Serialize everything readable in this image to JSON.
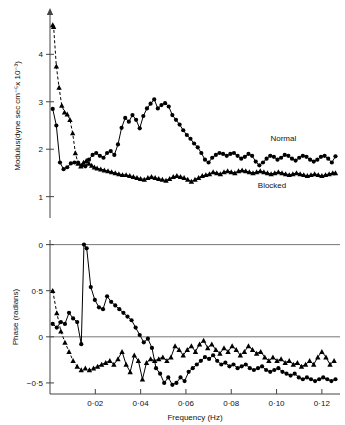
{
  "figure": {
    "background": "#ffffff",
    "ink": "#000000"
  },
  "chart_data": [
    {
      "type": "line",
      "id": "modulus-panel",
      "title": "",
      "xlabel": "",
      "ylabel": "Modulus(dyne sec cm⁻⁵x 10⁻³)",
      "xlim": [
        0.0,
        0.128
      ],
      "ylim": [
        0.55,
        4.85
      ],
      "yticks": [
        1,
        2,
        3,
        4
      ],
      "ytick_labels": [
        "1",
        "2",
        "3",
        "4"
      ],
      "xticks": [],
      "xtick_labels": [],
      "grid": false,
      "legend_position": "inline-annotation",
      "annotations": [
        {
          "text": "Normal",
          "x": 0.103,
          "y": 2.18
        },
        {
          "text": "Blocked",
          "x": 0.098,
          "y": 1.18
        }
      ],
      "series": [
        {
          "name": "Normal",
          "marker": "circle",
          "line": "solid",
          "x": [
            0.0012,
            0.0028,
            0.0044,
            0.006,
            0.0076,
            0.0092,
            0.0108,
            0.0124,
            0.014,
            0.0156,
            0.0172,
            0.0188,
            0.0204,
            0.022,
            0.0236,
            0.0252,
            0.0268,
            0.0284,
            0.03,
            0.0316,
            0.0332,
            0.0348,
            0.0364,
            0.038,
            0.0396,
            0.0412,
            0.0428,
            0.0444,
            0.046,
            0.0476,
            0.0492,
            0.0508,
            0.0524,
            0.054,
            0.0556,
            0.0572,
            0.0588,
            0.0604,
            0.062,
            0.0636,
            0.0652,
            0.0668,
            0.0684,
            0.07,
            0.0716,
            0.0732,
            0.0748,
            0.0764,
            0.078,
            0.0796,
            0.0812,
            0.0828,
            0.0844,
            0.086,
            0.0876,
            0.0892,
            0.0908,
            0.0924,
            0.094,
            0.0956,
            0.0972,
            0.0988,
            0.1004,
            0.102,
            0.1036,
            0.1052,
            0.1068,
            0.1084,
            0.11,
            0.1116,
            0.1132,
            0.1148,
            0.1164,
            0.118,
            0.1196,
            0.1212,
            0.1228,
            0.1244,
            0.126
          ],
          "y": [
            2.85,
            2.5,
            1.72,
            1.58,
            1.62,
            1.7,
            1.72,
            1.72,
            1.66,
            1.64,
            1.78,
            1.88,
            1.92,
            1.86,
            1.82,
            1.92,
            1.96,
            1.88,
            2.1,
            2.45,
            2.66,
            2.58,
            2.72,
            2.62,
            2.44,
            2.7,
            2.86,
            2.96,
            3.05,
            2.86,
            2.93,
            2.97,
            2.9,
            2.72,
            2.62,
            2.52,
            2.4,
            2.3,
            2.22,
            2.12,
            2.04,
            1.92,
            1.78,
            1.72,
            1.82,
            1.88,
            1.92,
            1.9,
            1.86,
            1.9,
            1.92,
            1.86,
            1.8,
            1.84,
            1.9,
            1.86,
            1.74,
            1.66,
            1.72,
            1.8,
            1.86,
            1.84,
            1.78,
            1.82,
            1.88,
            1.86,
            1.8,
            1.76,
            1.82,
            1.86,
            1.84,
            1.78,
            1.74,
            1.78,
            1.84,
            1.86,
            1.8,
            1.72,
            1.85
          ]
        },
        {
          "name": "Blocked",
          "marker": "triangle",
          "line": "dashed-then-solid",
          "x": [
            0.0012,
            0.0016,
            0.0028,
            0.004,
            0.0052,
            0.0064,
            0.0076,
            0.0088,
            0.01,
            0.0112,
            0.0124,
            0.0136,
            0.0148,
            0.016,
            0.0172,
            0.0184,
            0.0196,
            0.0208,
            0.0224,
            0.024,
            0.0256,
            0.0272,
            0.0288,
            0.0304,
            0.032,
            0.0336,
            0.0352,
            0.0368,
            0.0384,
            0.04,
            0.0416,
            0.0432,
            0.0448,
            0.0464,
            0.048,
            0.0496,
            0.0512,
            0.0528,
            0.0544,
            0.056,
            0.0576,
            0.0592,
            0.0608,
            0.0624,
            0.064,
            0.0656,
            0.0672,
            0.0688,
            0.0704,
            0.072,
            0.0736,
            0.0752,
            0.0768,
            0.0784,
            0.08,
            0.0816,
            0.0832,
            0.0848,
            0.0864,
            0.088,
            0.0896,
            0.0912,
            0.0928,
            0.0944,
            0.096,
            0.0976,
            0.0992,
            0.1008,
            0.1024,
            0.104,
            0.1056,
            0.1072,
            0.1088,
            0.1104,
            0.112,
            0.1136,
            0.1152,
            0.1168,
            0.1184,
            0.12,
            0.1216,
            0.1232,
            0.1248,
            0.126
          ],
          "y": [
            4.62,
            4.58,
            3.75,
            3.3,
            2.92,
            2.78,
            2.74,
            2.62,
            2.34,
            1.92,
            1.7,
            1.64,
            1.72,
            1.76,
            1.7,
            1.66,
            1.62,
            1.6,
            1.58,
            1.56,
            1.54,
            1.52,
            1.5,
            1.48,
            1.46,
            1.46,
            1.44,
            1.42,
            1.4,
            1.38,
            1.36,
            1.4,
            1.42,
            1.4,
            1.38,
            1.36,
            1.34,
            1.38,
            1.42,
            1.44,
            1.42,
            1.4,
            1.36,
            1.32,
            1.36,
            1.4,
            1.44,
            1.46,
            1.48,
            1.52,
            1.5,
            1.48,
            1.52,
            1.54,
            1.52,
            1.5,
            1.54,
            1.56,
            1.54,
            1.52,
            1.5,
            1.52,
            1.54,
            1.52,
            1.5,
            1.48,
            1.5,
            1.52,
            1.5,
            1.48,
            1.46,
            1.48,
            1.5,
            1.48,
            1.46,
            1.44,
            1.46,
            1.48,
            1.46,
            1.44,
            1.46,
            1.48,
            1.5,
            1.5
          ]
        }
      ]
    },
    {
      "type": "line",
      "id": "phase-panel",
      "title": "",
      "xlabel": "Frequency (Hz)",
      "ylabel": "Phase (radians)",
      "xlim": [
        0.0,
        0.128
      ],
      "ylim": [
        -0.62,
        1.05
      ],
      "yticks": [
        1.0,
        0.5,
        0.0,
        -0.5
      ],
      "ytick_labels": [
        "0",
        "0·5",
        "0",
        "−0·5"
      ],
      "xticks": [
        0.02,
        0.04,
        0.06,
        0.08,
        0.1,
        0.12
      ],
      "xtick_labels": [
        "0·02",
        "0·04",
        "0·06",
        "0·08",
        "0·10",
        "0·12"
      ],
      "grid": false,
      "gridlines_horizontal": [
        1.0,
        0.0
      ],
      "legend_position": "none",
      "series": [
        {
          "name": "Normal",
          "marker": "circle",
          "line": "solid",
          "x": [
            0.0012,
            0.003,
            0.0048,
            0.0066,
            0.0084,
            0.0102,
            0.012,
            0.0138,
            0.015,
            0.0162,
            0.018,
            0.0198,
            0.0216,
            0.0234,
            0.0252,
            0.027,
            0.0288,
            0.0306,
            0.0324,
            0.0342,
            0.036,
            0.0378,
            0.0396,
            0.0414,
            0.0432,
            0.045,
            0.0468,
            0.0486,
            0.0504,
            0.0522,
            0.054,
            0.0558,
            0.0576,
            0.0594,
            0.0612,
            0.063,
            0.0648,
            0.0666,
            0.0684,
            0.0702,
            0.072,
            0.0738,
            0.0756,
            0.0774,
            0.0792,
            0.081,
            0.0828,
            0.0846,
            0.0864,
            0.0882,
            0.09,
            0.0918,
            0.0936,
            0.0954,
            0.0972,
            0.099,
            0.1008,
            0.1026,
            0.1044,
            0.1062,
            0.108,
            0.1098,
            0.1116,
            0.1134,
            0.1152,
            0.117,
            0.1188,
            0.1206,
            0.1224,
            0.1242,
            0.126
          ],
          "y": [
            0.14,
            0.1,
            0.16,
            0.14,
            0.26,
            0.2,
            0.16,
            -0.08,
            1.0,
            0.96,
            0.54,
            0.4,
            0.32,
            0.3,
            0.44,
            0.38,
            0.34,
            0.3,
            0.26,
            0.22,
            0.18,
            0.1,
            0.02,
            -0.06,
            -0.02,
            -0.12,
            -0.34,
            -0.4,
            -0.5,
            -0.44,
            -0.52,
            -0.5,
            -0.44,
            -0.48,
            -0.38,
            -0.34,
            -0.3,
            -0.26,
            -0.22,
            -0.24,
            -0.2,
            -0.26,
            -0.3,
            -0.28,
            -0.32,
            -0.3,
            -0.34,
            -0.32,
            -0.3,
            -0.34,
            -0.36,
            -0.34,
            -0.32,
            -0.36,
            -0.38,
            -0.36,
            -0.34,
            -0.38,
            -0.4,
            -0.42,
            -0.4,
            -0.44,
            -0.46,
            -0.44,
            -0.46,
            -0.48,
            -0.46,
            -0.44,
            -0.46,
            -0.48,
            -0.46
          ]
        },
        {
          "name": "Blocked",
          "marker": "triangle",
          "line": "dashed-then-solid",
          "x": [
            0.0012,
            0.003,
            0.0048,
            0.0066,
            0.0084,
            0.0102,
            0.012,
            0.0138,
            0.0156,
            0.0174,
            0.0192,
            0.021,
            0.0228,
            0.0246,
            0.0264,
            0.0282,
            0.03,
            0.0318,
            0.0336,
            0.0354,
            0.0372,
            0.039,
            0.0408,
            0.0426,
            0.0444,
            0.0462,
            0.048,
            0.0498,
            0.0516,
            0.0534,
            0.0552,
            0.057,
            0.0588,
            0.0606,
            0.0624,
            0.0642,
            0.066,
            0.0678,
            0.0696,
            0.0714,
            0.0732,
            0.075,
            0.0768,
            0.0786,
            0.0804,
            0.0822,
            0.084,
            0.0858,
            0.0876,
            0.0894,
            0.0912,
            0.093,
            0.0948,
            0.0966,
            0.0984,
            0.1002,
            0.102,
            0.1038,
            0.1056,
            0.1074,
            0.1092,
            0.111,
            0.1128,
            0.1146,
            0.1164,
            0.1182,
            0.12,
            0.1218,
            0.1236,
            0.1254
          ],
          "y": [
            0.5,
            0.26,
            0.06,
            -0.06,
            -0.16,
            -0.26,
            -0.32,
            -0.36,
            -0.34,
            -0.36,
            -0.34,
            -0.32,
            -0.3,
            -0.28,
            -0.26,
            -0.3,
            -0.24,
            -0.16,
            -0.3,
            -0.38,
            -0.2,
            -0.26,
            -0.46,
            -0.28,
            -0.24,
            -0.26,
            -0.24,
            -0.22,
            -0.26,
            -0.22,
            -0.1,
            -0.14,
            -0.2,
            -0.14,
            -0.1,
            -0.16,
            -0.08,
            -0.04,
            -0.12,
            -0.08,
            -0.14,
            -0.18,
            -0.12,
            -0.16,
            -0.1,
            -0.14,
            -0.2,
            -0.16,
            -0.1,
            -0.14,
            -0.18,
            -0.16,
            -0.22,
            -0.26,
            -0.22,
            -0.26,
            -0.24,
            -0.28,
            -0.26,
            -0.3,
            -0.28,
            -0.32,
            -0.3,
            -0.26,
            -0.3,
            -0.22,
            -0.16,
            -0.22,
            -0.3,
            -0.26
          ]
        }
      ]
    }
  ]
}
